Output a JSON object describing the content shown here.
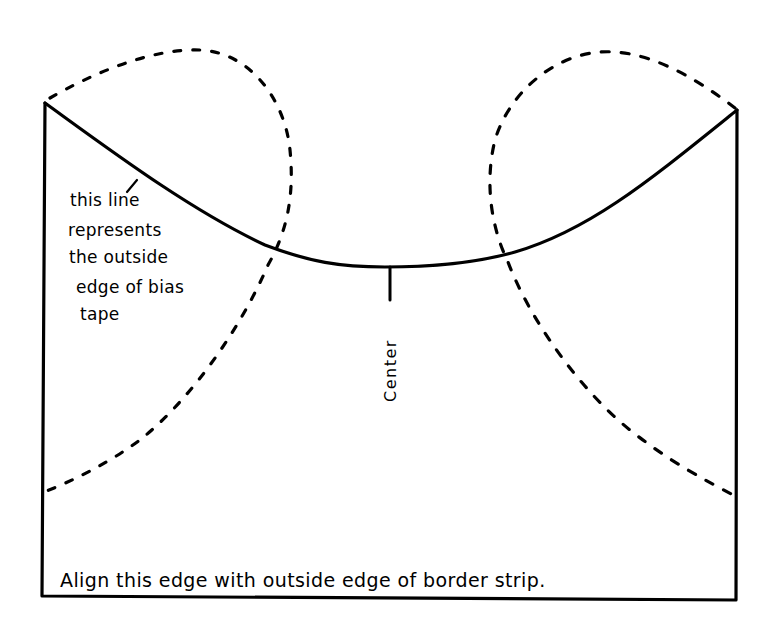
{
  "diagram": {
    "type": "sewing-pattern-template",
    "annotation": {
      "lines": [
        "this line",
        "represents",
        "the outside",
        "edge of bias",
        "tape"
      ]
    },
    "center_label": "Center",
    "caption": "Align this edge with outside edge of border strip.",
    "colors": {
      "ink": "#000000",
      "paper": "#ffffff"
    },
    "elements": {
      "solid_curve": "outside edge of bias tape (concave curve between top corners)",
      "dashed_curves": [
        "left loop",
        "right loop"
      ],
      "outline": "open-top rectangle (left, bottom, right edges)"
    }
  }
}
